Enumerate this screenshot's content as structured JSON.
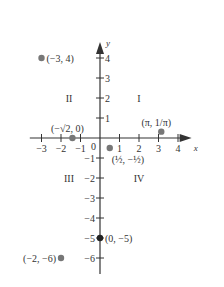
{
  "axes": {
    "x_label": "x",
    "y_label": "y",
    "origin_label": "0",
    "x_ticks": [
      -3,
      -2,
      -1,
      1,
      2,
      3,
      4
    ],
    "x_tick_labels": [
      "−3",
      "−2",
      "−1",
      "1",
      "2",
      "3",
      "4"
    ],
    "y_ticks": [
      4,
      3,
      2,
      1,
      -1,
      -2,
      -3,
      -4,
      -5,
      -6
    ],
    "y_tick_labels": [
      "4",
      "3",
      "2",
      "1",
      "−1",
      "−2",
      "−3",
      "−4",
      "−5",
      "−6"
    ],
    "x_range": [
      -3.6,
      4.7
    ],
    "y_range": [
      -6.8,
      4.8
    ]
  },
  "quadrants": [
    {
      "label": "I",
      "x": 2,
      "y": 2
    },
    {
      "label": "II",
      "x": -2,
      "y": 2
    },
    {
      "label": "III",
      "x": -2,
      "y": -2
    },
    {
      "label": "IV",
      "x": 2,
      "y": -2
    }
  ],
  "points": [
    {
      "x": -3,
      "y": 4,
      "label": "(−3, 4)",
      "anchor": "right"
    },
    {
      "x": -1.4142,
      "y": 0,
      "label": "(−√2, 0)",
      "anchor": "above"
    },
    {
      "x": 3.1416,
      "y": 0.3183,
      "label": "(π, 1/π)",
      "anchor": "above"
    },
    {
      "x": 0.5,
      "y": -0.5,
      "label": "(½, −½)",
      "anchor": "below-right"
    },
    {
      "x": 0,
      "y": -5,
      "label": "(0, −5)",
      "anchor": "right"
    },
    {
      "x": -2,
      "y": -6,
      "label": "(−2, −6)",
      "anchor": "left"
    }
  ],
  "colors": {
    "axis": "#333333",
    "point": "#777777",
    "point_on_axis": "#222222"
  }
}
